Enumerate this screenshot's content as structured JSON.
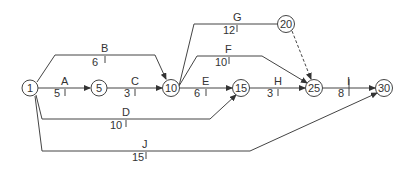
{
  "diagram": {
    "type": "activity-on-arrow network",
    "nodes": [
      {
        "id": "1",
        "label": "1"
      },
      {
        "id": "5",
        "label": "5"
      },
      {
        "id": "10",
        "label": "10"
      },
      {
        "id": "15",
        "label": "15"
      },
      {
        "id": "20",
        "label": "20"
      },
      {
        "id": "25",
        "label": "25"
      },
      {
        "id": "30",
        "label": "30"
      }
    ],
    "activities": [
      {
        "name": "A",
        "duration": "5",
        "from": "1",
        "to": "5"
      },
      {
        "name": "B",
        "duration": "6",
        "from": "1",
        "to": "10"
      },
      {
        "name": "C",
        "duration": "3",
        "from": "5",
        "to": "10"
      },
      {
        "name": "D",
        "duration": "10",
        "from": "1",
        "to": "15"
      },
      {
        "name": "E",
        "duration": "6",
        "from": "10",
        "to": "15"
      },
      {
        "name": "F",
        "duration": "10",
        "from": "10",
        "to": "25"
      },
      {
        "name": "G",
        "duration": "12",
        "from": "10",
        "to": "20"
      },
      {
        "name": "H",
        "duration": "3",
        "from": "15",
        "to": "25"
      },
      {
        "name": "I",
        "duration": "8",
        "from": "25",
        "to": "30"
      },
      {
        "name": "J",
        "duration": "15",
        "from": "1",
        "to": "30"
      }
    ],
    "dummy": {
      "from": "20",
      "to": "25",
      "style": "dashed"
    }
  }
}
